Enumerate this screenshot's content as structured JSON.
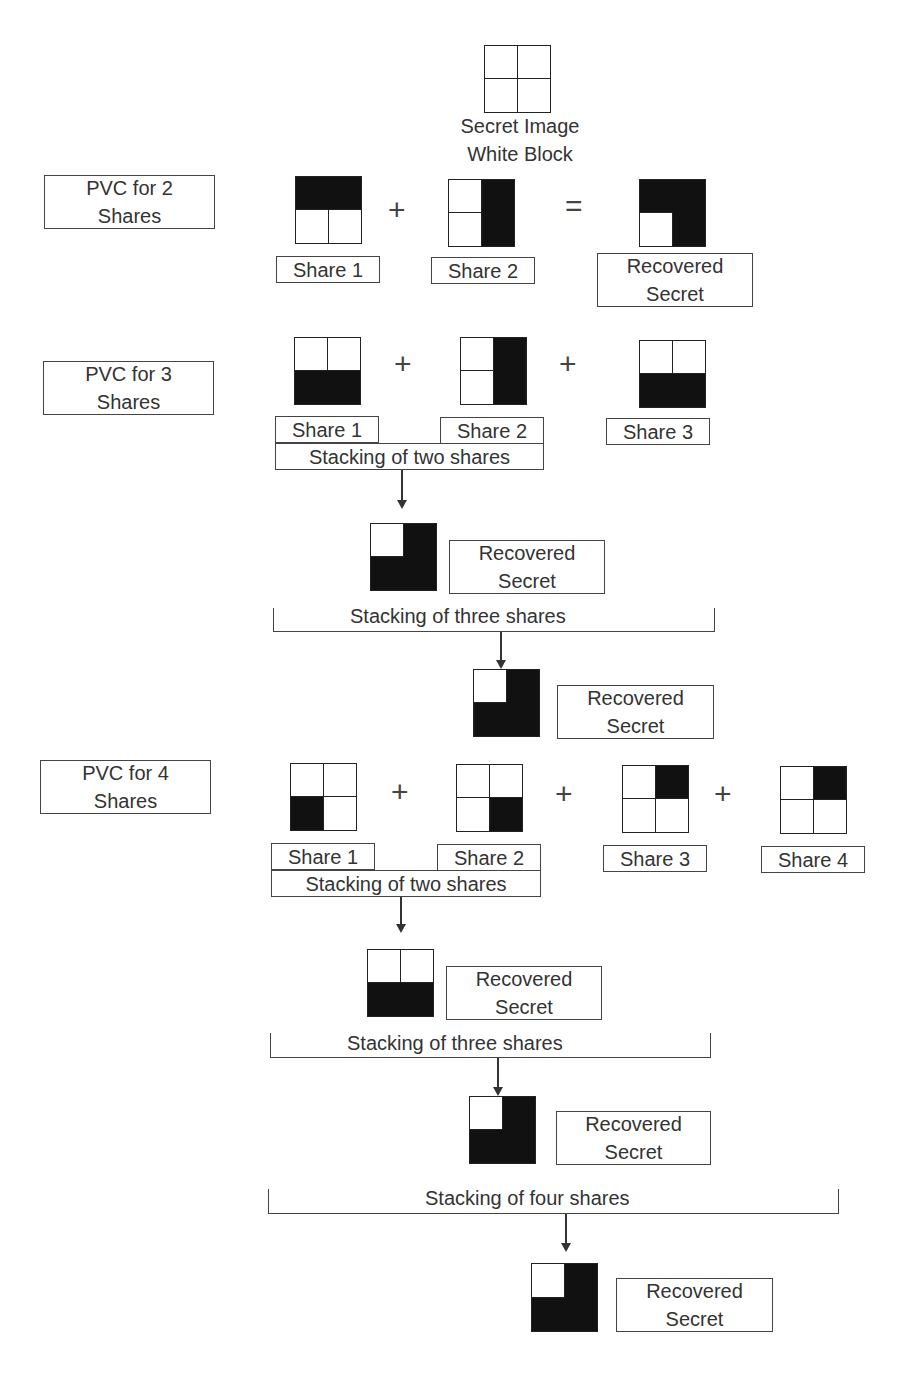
{
  "header": {
    "secret_label": "Secret Image\nWhite Block",
    "secret_pattern": [
      "w",
      "w",
      "w",
      "w"
    ]
  },
  "operators": {
    "plus": "+",
    "equals": "="
  },
  "sections": {
    "pvc2": {
      "title": "PVC for 2\nShares",
      "shares": [
        {
          "label": "Share 1",
          "pattern": [
            "b",
            "b",
            "w",
            "w"
          ]
        },
        {
          "label": "Share 2",
          "pattern": [
            "w",
            "b",
            "w",
            "b"
          ]
        }
      ],
      "result": {
        "label": "Recovered\nSecret",
        "pattern": [
          "b",
          "b",
          "w",
          "b"
        ]
      }
    },
    "pvc3": {
      "title": "PVC for 3\nShares",
      "shares": [
        {
          "label": "Share 1",
          "pattern": [
            "w",
            "w",
            "b",
            "b"
          ]
        },
        {
          "label": "Share 2",
          "pattern": [
            "w",
            "b",
            "w",
            "b"
          ]
        },
        {
          "label": "Share 3",
          "pattern": [
            "w",
            "w",
            "b",
            "b"
          ]
        }
      ],
      "stack_two": {
        "label": "Stacking of two shares",
        "result_label": "Recovered\nSecret",
        "pattern": [
          "w",
          "b",
          "b",
          "b"
        ]
      },
      "stack_three": {
        "label": "Stacking of three shares",
        "result_label": "Recovered\nSecret",
        "pattern": [
          "w",
          "b",
          "b",
          "b"
        ]
      }
    },
    "pvc4": {
      "title": "PVC for 4\nShares",
      "shares": [
        {
          "label": "Share 1",
          "pattern": [
            "w",
            "w",
            "b",
            "w"
          ]
        },
        {
          "label": "Share 2",
          "pattern": [
            "w",
            "w",
            "w",
            "b"
          ]
        },
        {
          "label": "Share 3",
          "pattern": [
            "w",
            "b",
            "w",
            "w"
          ]
        },
        {
          "label": "Share 4",
          "pattern": [
            "w",
            "b",
            "w",
            "w"
          ]
        }
      ],
      "stack_two": {
        "label": "Stacking of two shares",
        "result_label": "Recovered\nSecret",
        "pattern": [
          "w",
          "w",
          "b",
          "b"
        ]
      },
      "stack_three": {
        "label": "Stacking of three shares",
        "result_label": "Recovered\nSecret",
        "pattern": [
          "w",
          "b",
          "b",
          "b"
        ]
      },
      "stack_four": {
        "label": "Stacking of four shares",
        "result_label": "Recovered\nSecret",
        "pattern": [
          "w",
          "b",
          "b",
          "b"
        ]
      }
    }
  }
}
